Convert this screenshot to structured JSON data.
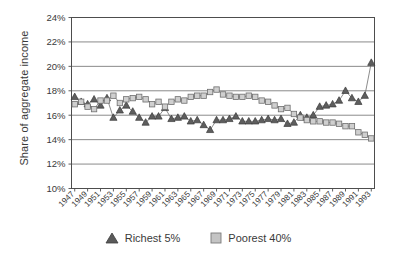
{
  "chart_data": {
    "type": "line",
    "title": "",
    "xlabel": "",
    "ylabel": "Share of aggregate income",
    "ylim": [
      10,
      24
    ],
    "ytick_values": [
      10,
      12,
      14,
      16,
      18,
      20,
      22,
      24
    ],
    "ytick_labels": [
      "10%",
      "12%",
      "14%",
      "16%",
      "18%",
      "20%",
      "22%",
      "24%"
    ],
    "grid": true,
    "legend_position": "bottom",
    "x": [
      1947,
      1948,
      1949,
      1950,
      1951,
      1952,
      1953,
      1954,
      1955,
      1956,
      1957,
      1958,
      1959,
      1960,
      1961,
      1962,
      1963,
      1964,
      1965,
      1966,
      1967,
      1968,
      1969,
      1970,
      1971,
      1972,
      1973,
      1974,
      1975,
      1976,
      1977,
      1978,
      1979,
      1980,
      1981,
      1982,
      1983,
      1984,
      1985,
      1986,
      1987,
      1988,
      1989,
      1990,
      1991,
      1992,
      1993
    ],
    "xtick_labels": [
      "1947",
      "1949",
      "1951",
      "1953",
      "1955",
      "1957",
      "1959",
      "1961",
      "1963",
      "1965",
      "1967",
      "1969",
      "1971",
      "1973",
      "1975",
      "1977",
      "1979",
      "1981",
      "1983",
      "1985",
      "1987",
      "1989",
      "1991",
      "1993"
    ],
    "series": [
      {
        "name": "Richest 5%",
        "marker": "triangle",
        "color": "#5a5a5a",
        "values": [
          17.5,
          17.1,
          16.9,
          17.3,
          16.8,
          17.4,
          15.8,
          16.4,
          16.8,
          16.3,
          15.8,
          15.4,
          15.9,
          15.9,
          16.6,
          15.7,
          15.8,
          15.9,
          15.5,
          15.6,
          15.2,
          14.8,
          15.6,
          15.6,
          15.7,
          15.9,
          15.5,
          15.5,
          15.5,
          15.6,
          15.7,
          15.6,
          15.7,
          15.3,
          15.4,
          16.0,
          15.8,
          16.0,
          16.7,
          16.8,
          16.9,
          17.2,
          18.0,
          17.4,
          17.1,
          17.6,
          20.3
        ]
      },
      {
        "name": "Poorest 40%",
        "marker": "square",
        "color": "#b8b8b8",
        "values": [
          16.9,
          17.1,
          16.7,
          16.5,
          17.2,
          17.2,
          17.6,
          17.0,
          17.3,
          17.4,
          17.5,
          17.3,
          16.9,
          17.1,
          16.7,
          17.1,
          17.3,
          17.2,
          17.5,
          17.6,
          17.6,
          17.9,
          18.1,
          17.7,
          17.6,
          17.5,
          17.5,
          17.6,
          17.5,
          17.2,
          17.1,
          16.8,
          16.5,
          16.6,
          16.1,
          15.8,
          15.6,
          15.5,
          15.5,
          15.4,
          15.4,
          15.3,
          15.1,
          15.1,
          14.6,
          14.4,
          14.1
        ]
      }
    ]
  },
  "legend": {
    "items": [
      {
        "label": "Richest 5%",
        "marker": "triangle",
        "color": "#5a5a5a"
      },
      {
        "label": "Poorest 40%",
        "marker": "square",
        "color": "#b8b8b8"
      }
    ]
  }
}
